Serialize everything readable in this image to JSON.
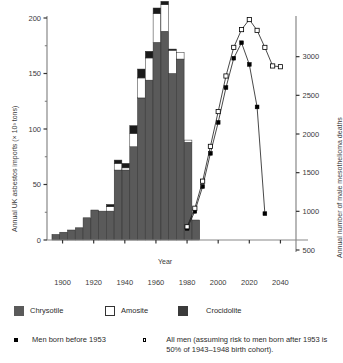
{
  "chart_data": {
    "type": "bar",
    "title": "",
    "xlabel": "Year",
    "ylabel_left": "Annual UK asbestos imports (× 10³ tons)",
    "ylabel_right": "Annual number of male mesothelioma deaths",
    "xlim": [
      1890,
      2050
    ],
    "xticks": [
      "1900",
      "1920",
      "1940",
      "1960",
      "1980",
      "2000",
      "2020",
      "2040"
    ],
    "xtick_values": [
      1900,
      1920,
      1940,
      1960,
      1980,
      2000,
      2020,
      2040
    ],
    "ylim_left": [
      0,
      200
    ],
    "yticks_left": [
      "0",
      "50",
      "100",
      "150",
      "200"
    ],
    "ytick_values_left": [
      0,
      50,
      100,
      150,
      200
    ],
    "yminor_left": [
      25,
      75,
      125,
      175
    ],
    "ylim_right": [
      500,
      3500
    ],
    "yticks_right": [
      "500",
      "1000",
      "1500",
      "2000",
      "2500",
      "3000"
    ],
    "ytick_values_right": [
      500,
      1000,
      1500,
      2000,
      2500,
      3000
    ],
    "grid": false,
    "legend_position": "below-plot",
    "bar_categories": [
      1895,
      1900,
      1905,
      1910,
      1915,
      1920,
      1925,
      1930,
      1935,
      1940,
      1945,
      1950,
      1955,
      1960,
      1965,
      1970,
      1975,
      1980,
      1985
    ],
    "bar_series": [
      {
        "name": "Chrysotile",
        "color": "#5a5a5a",
        "values": [
          5,
          7,
          9,
          11,
          20,
          27,
          26,
          26,
          63,
          63,
          84,
          128,
          144,
          178,
          188,
          150,
          163,
          88,
          18
        ]
      },
      {
        "name": "Amosite",
        "color": "#ffffff",
        "values": [
          0,
          0,
          0,
          0,
          0,
          0,
          0,
          4,
          6,
          2,
          12,
          18,
          20,
          26,
          24,
          21,
          6,
          2,
          0
        ]
      },
      {
        "name": "Crocidolite",
        "color": "#1a1a1a",
        "values": [
          0,
          0,
          0,
          0,
          0,
          0,
          0,
          2,
          3,
          4,
          7,
          8,
          6,
          5,
          3,
          1,
          0,
          0,
          0
        ]
      }
    ],
    "line_series": [
      {
        "name": "Men born before 1953",
        "marker": "filled-square",
        "x": [
          1980,
          1985,
          1990,
          1995,
          2000,
          2005,
          2010,
          2015,
          2020,
          2025,
          2030
        ],
        "y": [
          780,
          1000,
          1320,
          1750,
          2150,
          2600,
          2980,
          3180,
          2900,
          2350,
          970
        ]
      },
      {
        "name": "All men (assuming risk to men born after 1953 is 50% of 1943–1948 birth cohort)",
        "marker": "open-square",
        "x": [
          1980,
          1985,
          1990,
          1995,
          2000,
          2005,
          2010,
          2015,
          2020,
          2025,
          2030,
          2035,
          2040
        ],
        "y": [
          800,
          1040,
          1390,
          1840,
          2290,
          2750,
          3120,
          3350,
          3480,
          3340,
          3120,
          2880,
          2870
        ]
      }
    ]
  },
  "legend": {
    "bar_items": [
      {
        "label": "Chrysotile",
        "swatch": "filled-dark-square"
      },
      {
        "label": "Amosite",
        "swatch": "open-square"
      },
      {
        "label": "Crocidolite",
        "swatch": "filled-darker-square"
      }
    ],
    "line_items": [
      {
        "label": "Men born before 1953",
        "marker": "filled-small-square"
      },
      {
        "label": "All men (assuming risk to men born after 1953 is 50% of 1943–1948 birth cohort).",
        "marker": "open-small-square"
      }
    ]
  },
  "colors": {
    "chrysotile": "#5a5a5a",
    "amosite": "#ffffff",
    "crocidolite": "#1a1a1a",
    "axis": "#888888",
    "text": "#3a3a3a"
  }
}
